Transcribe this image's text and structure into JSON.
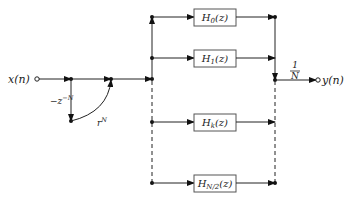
{
  "diagram": {
    "type": "frequency-sampling filter structure",
    "input": {
      "label": "x(n)"
    },
    "output": {
      "label": "y(n)"
    },
    "comb_feedforward": {
      "delay_label": "−z",
      "delay_exp": "−N",
      "gain_label": "r",
      "gain_exp": "N"
    },
    "scale": {
      "num": "1",
      "den": "N"
    },
    "filters": [
      {
        "name": "H",
        "sub": "0",
        "tail": "(z)"
      },
      {
        "name": "H",
        "sub": "1",
        "tail": "(z)"
      },
      {
        "name": "H",
        "sub": "k",
        "tail": "(z)"
      },
      {
        "name": "H",
        "sub": "N/2",
        "tail": "(z)"
      }
    ]
  }
}
